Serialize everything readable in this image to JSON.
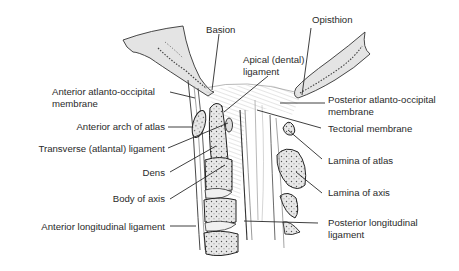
{
  "figure": {
    "colors": {
      "line": "#2a2a2a",
      "bone_fill": "#e6e6e6",
      "text": "#2a2a2a",
      "background": "#ffffff"
    }
  },
  "labels": {
    "basion": "Basion",
    "opisthion": "Opisthion",
    "apical_ligament_1": "Apical (dental)",
    "apical_ligament_2": "ligament",
    "ant_ao_membrane_1": "Anterior atlanto-occipital",
    "ant_ao_membrane_2": "membrane",
    "post_ao_membrane_1": "Posterior atlanto-occipital",
    "post_ao_membrane_2": "membrane",
    "anterior_arch_atlas": "Anterior arch of atlas",
    "tectorial_membrane": "Tectorial membrane",
    "transverse_ligament": "Transverse (atlantal) ligament",
    "lamina_atlas": "Lamina of atlas",
    "dens": "Dens",
    "lamina_axis": "Lamina of axis",
    "body_axis": "Body of axis",
    "ant_long_ligament": "Anterior longitudinal ligament",
    "post_long_ligament_1": "Posterior longitudinal",
    "post_long_ligament_2": "ligament"
  }
}
